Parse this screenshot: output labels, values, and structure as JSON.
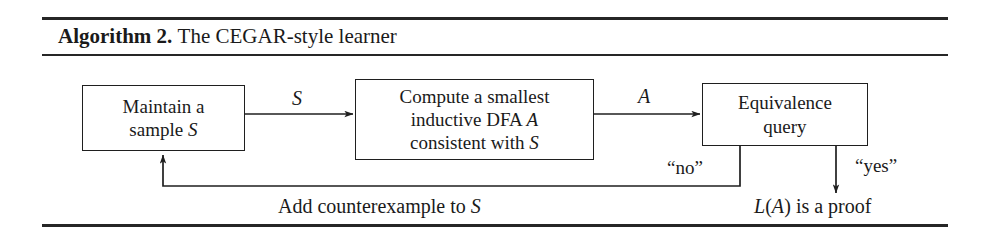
{
  "figure": {
    "caption": {
      "label": "Algorithm 2.",
      "title": "The CEGAR-style learner"
    },
    "nodes": [
      {
        "id": "maintain",
        "lines": [
          "Maintain a",
          "sample ᵊE"
        ],
        "line1": "Maintain a",
        "line2_prefix": "sample ",
        "line2_math": "S"
      },
      {
        "id": "compute",
        "line1": "Compute a smallest",
        "line2_prefix": "inductive DFA ",
        "line2_math": "A",
        "line3_prefix": "consistent with ",
        "line3_math": "S"
      },
      {
        "id": "equivalence",
        "line1": "Equivalence",
        "line2": "query"
      }
    ],
    "edge_labels": {
      "sample_flow": "S",
      "automaton_flow": "A",
      "no": "“no”",
      "yes": "“yes”"
    },
    "flow_captions": {
      "add_counterexample_prefix": "Add counterexample to ",
      "add_counterexample_math": "S",
      "proof_l": "L",
      "proof_open": "(",
      "proof_math": "A",
      "proof_rest": ") is a proof"
    },
    "colors": {
      "ink": "#1a1a1a",
      "rule": "#262626",
      "box_border": "#1f1f1f",
      "background": "#ffffff"
    }
  }
}
